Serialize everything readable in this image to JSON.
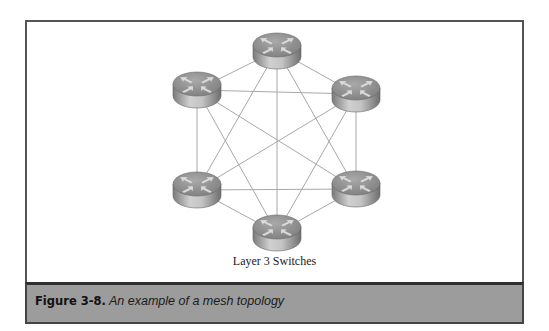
{
  "diagram": {
    "title": "Mesh topology",
    "label": "Layer 3 Switches",
    "node_type": "router-icon",
    "nodes": [
      {
        "id": "top",
        "cx": 277,
        "cy": 45
      },
      {
        "id": "upper-left",
        "cx": 197,
        "cy": 84
      },
      {
        "id": "upper-right",
        "cx": 356,
        "cy": 88
      },
      {
        "id": "lower-left",
        "cx": 197,
        "cy": 184
      },
      {
        "id": "lower-right",
        "cx": 356,
        "cy": 183
      },
      {
        "id": "bottom",
        "cx": 277,
        "cy": 227
      }
    ],
    "edges": "full-mesh",
    "colors": {
      "edge": "#a8a8a8",
      "router_top": "#8e8e8e",
      "router_body": "#b5b5b5",
      "arrow": "#d8d8d8"
    }
  },
  "caption": {
    "number": "Figure 3-8.",
    "text": "An example of a mesh topology",
    "band_color": "#9c9c9c"
  }
}
